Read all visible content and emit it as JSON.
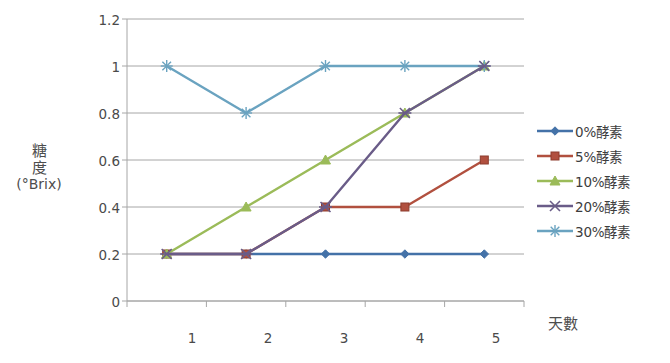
{
  "chart_data": {
    "type": "line",
    "title": "",
    "xlabel": "天數",
    "ylabel": "糖度(°Brix)",
    "ylabel_lines": [
      "糖",
      "度",
      "(°Brix)"
    ],
    "categories": [
      "1",
      "2",
      "3",
      "4",
      "5"
    ],
    "x": [
      1,
      2,
      3,
      4,
      5
    ],
    "ylim": [
      0,
      1.2
    ],
    "yticks": [
      "0",
      "0.2",
      "0.4",
      "0.6",
      "0.8",
      "1",
      "1.2"
    ],
    "ytick_values": [
      0,
      0.2,
      0.4,
      0.6,
      0.8,
      1,
      1.2
    ],
    "grid": "horizontal",
    "legend_position": "right",
    "series": [
      {
        "name": "0%酵素",
        "values": [
          0.2,
          0.2,
          0.2,
          0.2,
          0.2
        ],
        "color": "#4472a8",
        "marker": "diamond"
      },
      {
        "name": "5%酵素",
        "values": [
          0.2,
          0.2,
          0.4,
          0.4,
          0.6
        ],
        "color": "#b1503f",
        "marker": "square"
      },
      {
        "name": "10%酵素",
        "values": [
          0.2,
          0.4,
          0.6,
          0.8,
          1.0
        ],
        "color": "#9bbb59",
        "marker": "triangle"
      },
      {
        "name": "20%酵素",
        "values": [
          0.2,
          0.2,
          0.4,
          0.8,
          1.0
        ],
        "color": "#6a5c88",
        "marker": "cross"
      },
      {
        "name": "30%酵素",
        "values": [
          1.0,
          0.8,
          1.0,
          1.0,
          1.0
        ],
        "color": "#6aa3c0",
        "marker": "asterisk"
      }
    ]
  },
  "axes": {
    "y_title_line1": "糖",
    "y_title_line2": "度",
    "y_title_line3": "(°Brix)",
    "x_title": "天數",
    "ytick_0": "0",
    "ytick_1": "0.2",
    "ytick_2": "0.4",
    "ytick_3": "0.6",
    "ytick_4": "0.8",
    "ytick_5": "1",
    "ytick_6": "1.2",
    "xtick_0": "1",
    "xtick_1": "2",
    "xtick_2": "3",
    "xtick_3": "4",
    "xtick_4": "5"
  },
  "legend": {
    "items": [
      {
        "label": "0%酵素",
        "color": "#4472a8"
      },
      {
        "label": "5%酵素",
        "color": "#b1503f"
      },
      {
        "label": "10%酵素",
        "color": "#9bbb59"
      },
      {
        "label": "20%酵素",
        "color": "#6a5c88"
      },
      {
        "label": "30%酵素",
        "color": "#6aa3c0"
      }
    ]
  }
}
